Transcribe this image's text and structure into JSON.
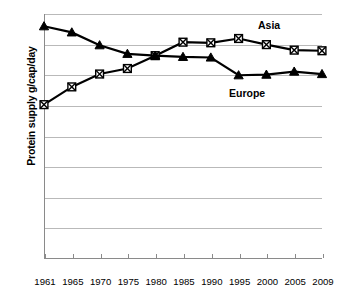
{
  "chart_data": {
    "type": "line",
    "title": "",
    "xlabel": "",
    "ylabel": "Protein supply g/cap/day",
    "categories": [
      "1961",
      "1965",
      "1970",
      "1975",
      "1980",
      "1985",
      "1990",
      "1995",
      "2000",
      "2005",
      "2009"
    ],
    "ylim": [
      0,
      40
    ],
    "yticks": [
      "0",
      "5",
      "10",
      "15",
      "20",
      "25",
      "30",
      "35",
      "40"
    ],
    "grid": true,
    "legend_position": "inline-annotation",
    "series": [
      {
        "name": "Asia",
        "marker": "crossed-square",
        "values": [
          25.2,
          28.1,
          30.2,
          31.1,
          33.2,
          35.4,
          35.3,
          36.0,
          35.0,
          34.1,
          34.0
        ]
      },
      {
        "name": "Europe",
        "marker": "triangle",
        "values": [
          38.0,
          37.0,
          34.9,
          33.5,
          33.2,
          33.0,
          32.9,
          30.0,
          30.1,
          30.6,
          30.2
        ]
      }
    ],
    "annotations": [
      {
        "text": "Asia",
        "x": "2002",
        "y": 37.5
      },
      {
        "text": "Europe",
        "x": "1997",
        "y": 26.5
      }
    ],
    "colors": {
      "line": "#000000",
      "grid": "#b9b9b9",
      "axis": "#8a8a8a",
      "background": "#ffffff"
    }
  }
}
